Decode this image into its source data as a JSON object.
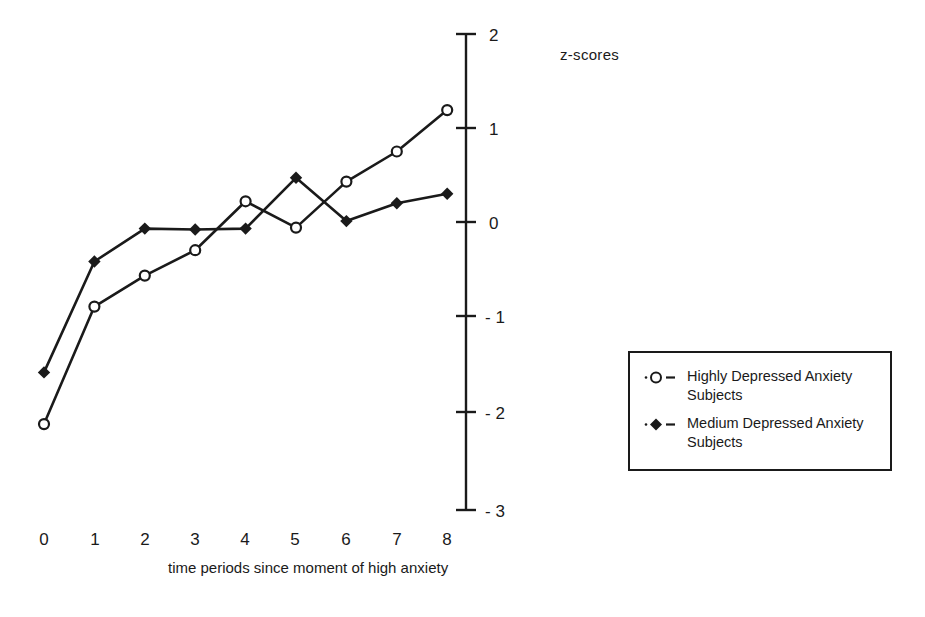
{
  "chart_data": {
    "type": "line",
    "title": "",
    "xlabel": "time periods since moment of high anxiety",
    "ylabel": "z-scores",
    "x": [
      0,
      1,
      2,
      3,
      4,
      5,
      6,
      7,
      8
    ],
    "xtick_labels": [
      "0",
      "1",
      "2",
      "3",
      "4",
      "5",
      "6",
      "7",
      "8"
    ],
    "ytick_labels": [
      "2",
      "1",
      "0",
      "- 1",
      "- 2",
      "- 3"
    ],
    "ytick_values": [
      2,
      1,
      0,
      -1,
      -2,
      -3
    ],
    "xlim": [
      -0.45,
      8.3
    ],
    "ylim": [
      -3,
      2
    ],
    "grid": false,
    "legend_position": "right",
    "series": [
      {
        "name": "Highly Depressed Anxiety Subjects",
        "marker": "open-circle",
        "values": [
          -2.15,
          -0.9,
          -0.57,
          -0.3,
          0.22,
          -0.06,
          0.43,
          0.75,
          1.19
        ]
      },
      {
        "name": "Medium Depressed Anxiety Subjects",
        "marker": "filled-diamond",
        "values": [
          -1.6,
          -0.42,
          -0.07,
          -0.08,
          -0.07,
          0.47,
          0.01,
          0.2,
          0.3
        ]
      }
    ]
  },
  "axis": {
    "ylabel_text": "z-scores",
    "xlabel_text": "time periods since moment of high anxiety"
  },
  "legend": {
    "entries": [
      {
        "label": "Highly Depressed Anxiety\nSubjects",
        "marker": "open-circle"
      },
      {
        "label": "Medium Depressed Anxiety\nSubjects",
        "marker": "filled-diamond"
      }
    ]
  },
  "colors": {
    "ink": "#1a1a1a",
    "background": "#ffffff"
  }
}
